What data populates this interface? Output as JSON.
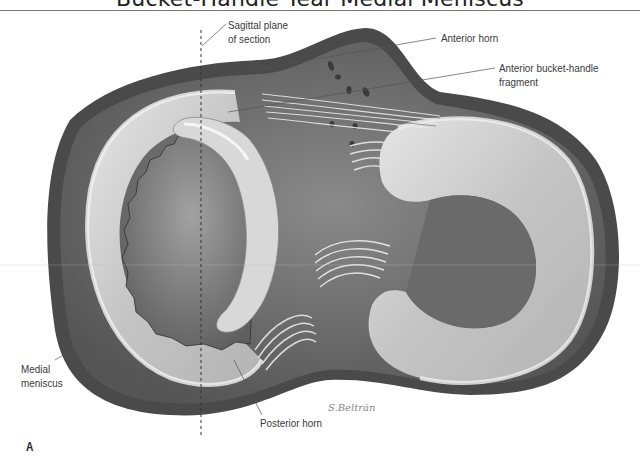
{
  "figure": {
    "title": "Bucket-Handle Tear Medial Meniscus",
    "panel_letter": "A",
    "signature": "S.Beltrán"
  },
  "labels": {
    "sagittal_plane": [
      "Sagittal plane",
      "of section"
    ],
    "anterior_horn": "Anterior horn",
    "anterior_fragment": [
      "Anterior bucket-handle",
      "fragment"
    ],
    "medial_meniscus": [
      "Medial",
      "meniscus"
    ],
    "posterior_horn": "Posterior horn"
  },
  "colors": {
    "background": "#ffffff",
    "tibial_rim": "#4a4a4a",
    "plateau": "#6e6e6e",
    "meniscus": "#c8c8c8",
    "meniscus_highlight": "#eeeeee",
    "label_text": "#3a3a3a",
    "leader_line": "#555555"
  }
}
